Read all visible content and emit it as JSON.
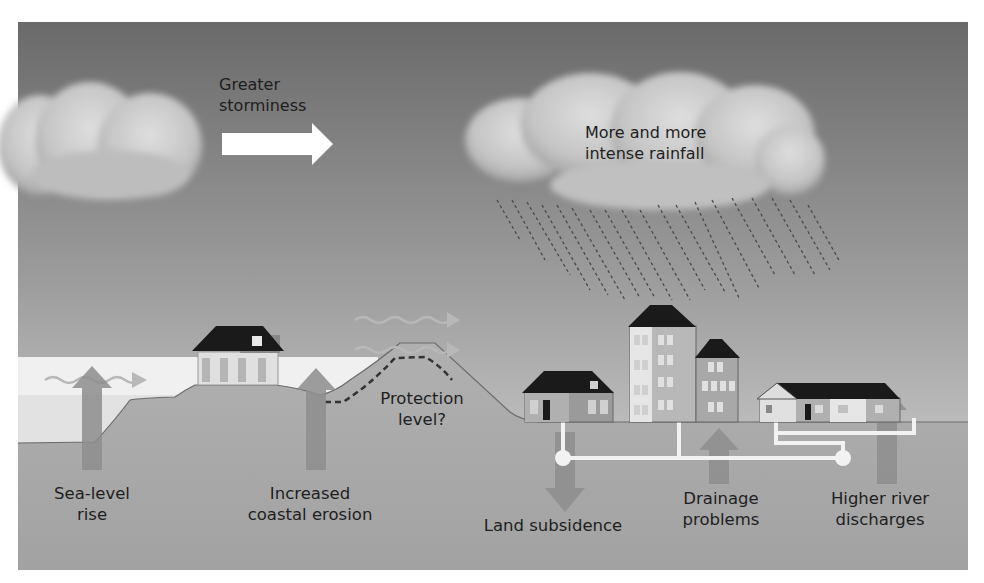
{
  "diagram": {
    "title_labels": {
      "storminess": [
        "Greater",
        "storminess"
      ],
      "rainfall": [
        "More and more",
        "intense rainfall"
      ],
      "protection": [
        "Protection",
        "level?"
      ]
    },
    "bottom_labels": {
      "sea_level": [
        "Sea-level",
        "rise"
      ],
      "erosion": [
        "Increased",
        "coastal erosion"
      ],
      "subsidence": [
        "Land subsidence"
      ],
      "drainage": [
        "Drainage",
        "problems"
      ],
      "river": [
        "Higher river",
        "discharges"
      ]
    },
    "colors": {
      "sky_top": "#6e6e6e",
      "sky_bottom": "#d6d6d6",
      "ground": "#a8a8a8",
      "sea": "#e8e8e8",
      "cloud": "#cfcfcf",
      "arrow": "#8c8c8c",
      "roof": "#1a1a1a",
      "text": "#1e1e1e"
    }
  }
}
